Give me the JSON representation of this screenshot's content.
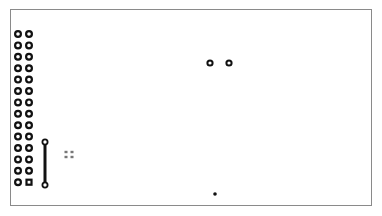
{
  "board": {
    "outline": {
      "x": 10,
      "y": 9,
      "width": 362,
      "height": 197,
      "color": "#8a8a8a"
    },
    "pad_color": "#111111"
  },
  "header": {
    "label": "2x14 pin header",
    "rows": 14,
    "cols": 2,
    "col_x": [
      18,
      29
    ],
    "first_row_y": 34,
    "row_pitch": 11.4,
    "square_pad": {
      "row": 13,
      "col": 1
    }
  },
  "jumper": {
    "x": 45,
    "y1": 142,
    "y2": 185
  },
  "pads": [
    {
      "name": "pad-a",
      "x": 210,
      "y": 63
    },
    {
      "name": "pad-b",
      "x": 229,
      "y": 63
    }
  ],
  "smd_cluster": [
    {
      "x": 66,
      "y": 152
    },
    {
      "x": 72,
      "y": 152
    },
    {
      "x": 66,
      "y": 157
    },
    {
      "x": 72,
      "y": 157
    }
  ],
  "via": {
    "x": 215,
    "y": 194
  }
}
